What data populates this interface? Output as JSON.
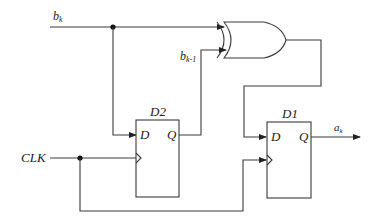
{
  "diagram": {
    "type": "sequential-logic-circuit",
    "signals": {
      "input_b": "b",
      "input_b_sub": "k",
      "feedback_b": "b",
      "feedback_b_sub": "k-1",
      "clock": "CLK",
      "output_a": "a",
      "output_a_sub": "k"
    },
    "flipflops": [
      {
        "id": "D2",
        "label": "D2",
        "d_pin": "D",
        "q_pin": "Q"
      },
      {
        "id": "D1",
        "label": "D1",
        "d_pin": "D",
        "q_pin": "Q"
      }
    ],
    "gates": [
      {
        "id": "xor1",
        "type": "XOR",
        "inputs": [
          "b_k",
          "b_k-1"
        ],
        "output": "D1.D"
      }
    ],
    "connections": [
      {
        "from": "b_k",
        "to": "XOR.in1"
      },
      {
        "from": "b_k",
        "to": "D2.D"
      },
      {
        "from": "D2.Q",
        "to": "XOR.in2",
        "net": "b_k-1"
      },
      {
        "from": "XOR.out",
        "to": "D1.D"
      },
      {
        "from": "CLK",
        "to": "D2.clk"
      },
      {
        "from": "CLK",
        "to": "D1.clk"
      },
      {
        "from": "D1.Q",
        "to": "a_k"
      }
    ],
    "colors": {
      "line": "#3a3a3a",
      "junction": "#111111",
      "background": "#ffffff"
    }
  }
}
